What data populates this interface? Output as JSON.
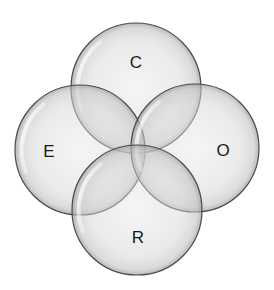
{
  "diagram": {
    "type": "venn",
    "sets": [
      {
        "id": "C",
        "label": "C",
        "cx": 136,
        "cy": 88,
        "r": 65,
        "label_x": 136,
        "label_y": 62
      },
      {
        "id": "E",
        "label": "E",
        "cx": 80,
        "cy": 150,
        "r": 65,
        "label_x": 49,
        "label_y": 151
      },
      {
        "id": "O",
        "label": "O",
        "cx": 195,
        "cy": 148,
        "r": 64,
        "label_x": 223,
        "label_y": 150
      },
      {
        "id": "R",
        "label": "R",
        "cx": 137,
        "cy": 210,
        "r": 65,
        "label_x": 138,
        "label_y": 237
      }
    ],
    "colors": {
      "fill_light": "#f4f4f4",
      "fill_dark": "#cfcfcf",
      "stroke": "#4a4a4a",
      "text": "#1a1a1a"
    }
  }
}
